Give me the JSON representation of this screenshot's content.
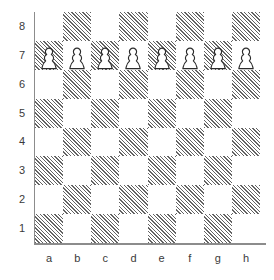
{
  "diagram": {
    "board_size": 8,
    "orientation": "white-bottom",
    "colors": {
      "light_square": "#ffffff",
      "dark_square_hatch": "#636363",
      "axis_line": "#8c8c8c",
      "label_text": "#3a3a3a",
      "piece_outline": "#2b2b2b",
      "piece_fill": "#ffffff"
    }
  },
  "labels": {
    "files": [
      "a",
      "b",
      "c",
      "d",
      "e",
      "f",
      "g",
      "h"
    ],
    "ranks": [
      "8",
      "7",
      "6",
      "5",
      "4",
      "3",
      "2",
      "1"
    ]
  },
  "chart_data": {
    "type": "table",
    "xlabel": "file",
    "ylabel": "rank",
    "categories": [
      "a",
      "b",
      "c",
      "d",
      "e",
      "f",
      "g",
      "h"
    ],
    "ranks": [
      "8",
      "7",
      "6",
      "5",
      "4",
      "3",
      "2",
      "1"
    ],
    "grid": true,
    "legend": "none",
    "square_colors": [
      [
        "light",
        "dark",
        "light",
        "dark",
        "light",
        "dark",
        "light",
        "dark"
      ],
      [
        "dark",
        "light",
        "dark",
        "light",
        "dark",
        "light",
        "dark",
        "light"
      ],
      [
        "light",
        "dark",
        "light",
        "dark",
        "light",
        "dark",
        "light",
        "dark"
      ],
      [
        "dark",
        "light",
        "dark",
        "light",
        "dark",
        "light",
        "dark",
        "light"
      ],
      [
        "light",
        "dark",
        "light",
        "dark",
        "light",
        "dark",
        "light",
        "dark"
      ],
      [
        "dark",
        "light",
        "dark",
        "light",
        "dark",
        "light",
        "dark",
        "light"
      ],
      [
        "light",
        "dark",
        "light",
        "dark",
        "light",
        "dark",
        "light",
        "dark"
      ],
      [
        "dark",
        "light",
        "dark",
        "light",
        "dark",
        "light",
        "dark",
        "light"
      ]
    ],
    "pieces": [
      [
        "",
        "",
        "",
        "",
        "",
        "",
        "",
        ""
      ],
      [
        "white-pawn",
        "white-pawn",
        "white-pawn",
        "white-pawn",
        "white-pawn",
        "white-pawn",
        "white-pawn",
        "white-pawn"
      ],
      [
        "",
        "",
        "",
        "",
        "",
        "",
        "",
        ""
      ],
      [
        "",
        "",
        "",
        "",
        "",
        "",
        "",
        ""
      ],
      [
        "",
        "",
        "",
        "",
        "",
        "",
        "",
        ""
      ],
      [
        "",
        "",
        "",
        "",
        "",
        "",
        "",
        ""
      ],
      [
        "",
        "",
        "",
        "",
        "",
        "",
        "",
        ""
      ],
      [
        "",
        "",
        "",
        "",
        "",
        "",
        "",
        ""
      ]
    ],
    "occupied_squares": [
      "a7",
      "b7",
      "c7",
      "d7",
      "e7",
      "f7",
      "g7",
      "h7"
    ],
    "piece_counts": {
      "white-pawn": 8
    }
  }
}
